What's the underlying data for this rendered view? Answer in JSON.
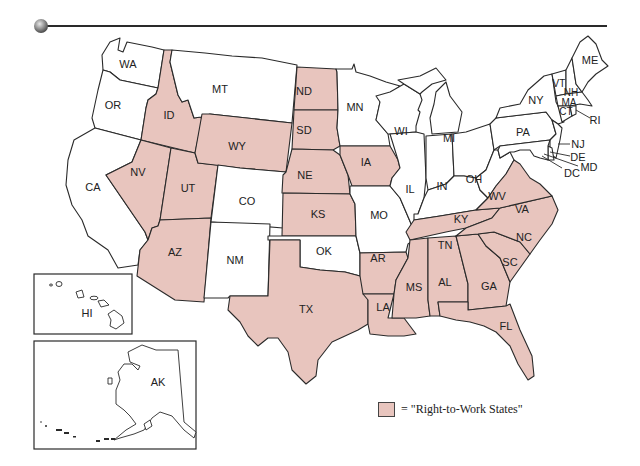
{
  "header": {
    "rule_color": "#2a2a2a",
    "bullet": "gray-sphere"
  },
  "legend": {
    "swatch_color": "#e8c5be",
    "label": "= \"Right-to-Work States\""
  },
  "colors": {
    "right_to_work": "#e8c5be",
    "other": "#ffffff",
    "border": "#2a2a2a"
  },
  "states": {
    "WA": {
      "label": "WA",
      "right_to_work": false
    },
    "OR": {
      "label": "OR",
      "right_to_work": false
    },
    "CA": {
      "label": "CA",
      "right_to_work": false
    },
    "ID": {
      "label": "ID",
      "right_to_work": true
    },
    "NV": {
      "label": "NV",
      "right_to_work": true
    },
    "UT": {
      "label": "UT",
      "right_to_work": true
    },
    "AZ": {
      "label": "AZ",
      "right_to_work": true
    },
    "MT": {
      "label": "MT",
      "right_to_work": false
    },
    "WY": {
      "label": "WY",
      "right_to_work": true
    },
    "CO": {
      "label": "CO",
      "right_to_work": false
    },
    "NM": {
      "label": "NM",
      "right_to_work": false
    },
    "ND": {
      "label": "ND",
      "right_to_work": true
    },
    "SD": {
      "label": "SD",
      "right_to_work": true
    },
    "NE": {
      "label": "NE",
      "right_to_work": true
    },
    "KS": {
      "label": "KS",
      "right_to_work": true
    },
    "OK": {
      "label": "OK",
      "right_to_work": false
    },
    "TX": {
      "label": "TX",
      "right_to_work": true
    },
    "MN": {
      "label": "MN",
      "right_to_work": false
    },
    "IA": {
      "label": "IA",
      "right_to_work": true
    },
    "MO": {
      "label": "MO",
      "right_to_work": false
    },
    "AR": {
      "label": "AR",
      "right_to_work": true
    },
    "LA": {
      "label": "LA",
      "right_to_work": true
    },
    "WI": {
      "label": "WI",
      "right_to_work": false
    },
    "IL": {
      "label": "IL",
      "right_to_work": false
    },
    "MI": {
      "label": "MI",
      "right_to_work": false
    },
    "IN": {
      "label": "IN",
      "right_to_work": false
    },
    "OH": {
      "label": "OH",
      "right_to_work": false
    },
    "KY": {
      "label": "KY",
      "right_to_work": false
    },
    "TN": {
      "label": "TN",
      "right_to_work": true
    },
    "MS": {
      "label": "MS",
      "right_to_work": true
    },
    "AL": {
      "label": "AL",
      "right_to_work": true
    },
    "GA": {
      "label": "GA",
      "right_to_work": true
    },
    "FL": {
      "label": "FL",
      "right_to_work": true
    },
    "SC": {
      "label": "SC",
      "right_to_work": true
    },
    "NC": {
      "label": "NC",
      "right_to_work": true
    },
    "VA": {
      "label": "VA",
      "right_to_work": true
    },
    "WV": {
      "label": "WV",
      "right_to_work": false
    },
    "PA": {
      "label": "PA",
      "right_to_work": false
    },
    "NY": {
      "label": "NY",
      "right_to_work": false
    },
    "VT": {
      "label": "VT",
      "right_to_work": false
    },
    "NH": {
      "label": "NH",
      "right_to_work": false
    },
    "ME": {
      "label": "ME",
      "right_to_work": false
    },
    "MA": {
      "label": "MA",
      "right_to_work": false
    },
    "RI": {
      "label": "RI",
      "right_to_work": false
    },
    "CT": {
      "label": "CT",
      "right_to_work": false
    },
    "NJ": {
      "label": "NJ",
      "right_to_work": false
    },
    "DE": {
      "label": "DE",
      "right_to_work": false
    },
    "MD": {
      "label": "MD",
      "right_to_work": false
    },
    "DC": {
      "label": "DC",
      "right_to_work": false
    },
    "HI": {
      "label": "HI",
      "right_to_work": false
    },
    "AK": {
      "label": "AK",
      "right_to_work": false
    }
  }
}
